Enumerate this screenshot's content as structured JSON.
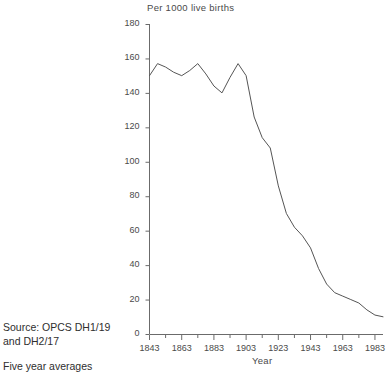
{
  "chart_data": {
    "type": "line",
    "title": "",
    "ylabel": "Per 1000 live births",
    "xlabel": "Year",
    "ylim": [
      0,
      180
    ],
    "xlim": [
      1843,
      1988
    ],
    "y_ticks": [
      0,
      20,
      40,
      60,
      80,
      100,
      120,
      140,
      160,
      180
    ],
    "x_ticks": [
      1843,
      1863,
      1883,
      1903,
      1923,
      1943,
      1963,
      1983
    ],
    "x_minor_tick_step": 10,
    "grid": false,
    "legend": null,
    "line_color": "#555555",
    "series": [
      {
        "name": "Infant mortality rate",
        "x": [
          1843,
          1848,
          1853,
          1858,
          1863,
          1868,
          1873,
          1878,
          1883,
          1888,
          1893,
          1898,
          1903,
          1908,
          1913,
          1918,
          1923,
          1928,
          1933,
          1938,
          1943,
          1948,
          1953,
          1958,
          1963,
          1968,
          1973,
          1978,
          1983,
          1988
        ],
        "values": [
          150,
          157,
          155,
          152,
          150,
          153,
          157,
          151,
          144,
          140,
          149,
          157,
          150,
          126,
          114,
          108,
          86,
          70,
          62,
          57,
          50,
          38,
          29,
          24,
          22,
          20,
          18,
          14,
          11,
          10
        ]
      }
    ]
  },
  "notes": {
    "source_line_1": "Source: OPCS DH1/19",
    "source_line_2": "and DH2/17",
    "averaging_note": "Five year averages"
  }
}
